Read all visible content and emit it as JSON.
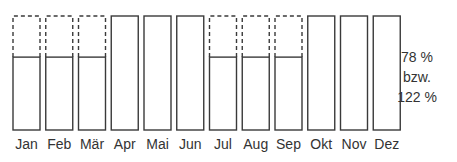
{
  "chart_data": {
    "type": "bar",
    "title": "",
    "xlabel": "",
    "ylabel": "",
    "categories": [
      "Jan",
      "Feb",
      "Mär",
      "Apr",
      "Mai",
      "Jun",
      "Jul",
      "Aug",
      "Sep",
      "Okt",
      "Nov",
      "Dez"
    ],
    "series": [
      {
        "name": "solid",
        "values": [
          78,
          78,
          78,
          122,
          122,
          122,
          78,
          78,
          78,
          122,
          122,
          122
        ]
      },
      {
        "name": "dashed-outline",
        "values": [
          122,
          122,
          122,
          null,
          null,
          null,
          122,
          122,
          122,
          null,
          null,
          null
        ]
      }
    ],
    "annotation": [
      "78 %",
      "bzw.",
      "122 %"
    ],
    "ylim": [
      0,
      122
    ],
    "grid": false,
    "legend": "none"
  },
  "colors": {
    "stroke": "#3a3a3a",
    "text": "#333333",
    "background": "#ffffff"
  }
}
